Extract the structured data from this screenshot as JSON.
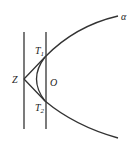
{
  "diagram": {
    "labels": {
      "alpha": "α",
      "Z": "Z",
      "O": "O",
      "T1": "T",
      "T1_sub": "1",
      "T2": "T",
      "T2_sub": "2"
    },
    "colors": {
      "stroke": "#333333",
      "text": "#222222"
    }
  }
}
